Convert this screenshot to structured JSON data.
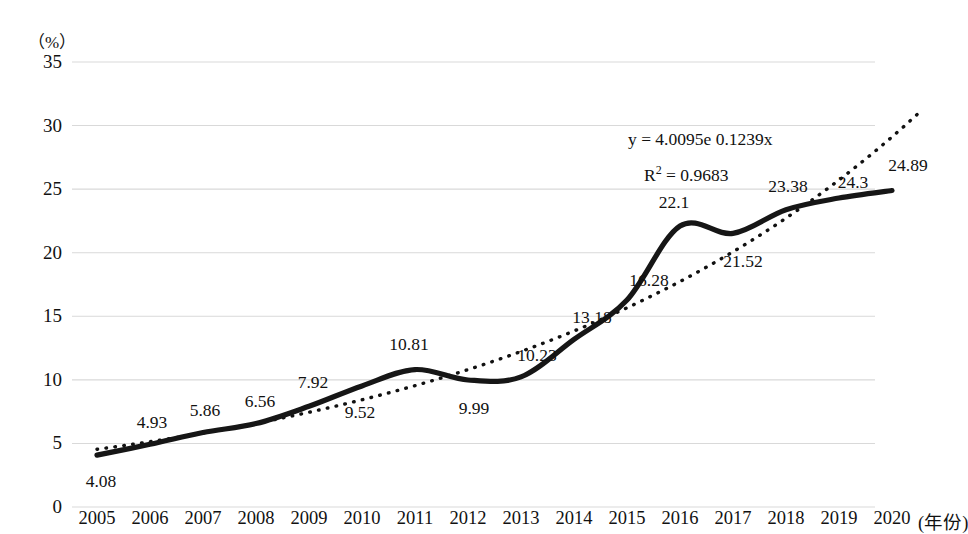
{
  "chart_data": {
    "type": "line",
    "title": "",
    "xlabel": "(年份)",
    "ylabel": "(%)",
    "x": [
      2005,
      2006,
      2007,
      2008,
      2009,
      2010,
      2011,
      2012,
      2013,
      2014,
      2015,
      2016,
      2017,
      2018,
      2019,
      2020
    ],
    "categories": [
      "2005",
      "2006",
      "2007",
      "2008",
      "2009",
      "2010",
      "2011",
      "2012",
      "2013",
      "2014",
      "2015",
      "2016",
      "2017",
      "2018",
      "2019",
      "2020"
    ],
    "values": [
      4.08,
      4.93,
      5.86,
      6.56,
      7.92,
      9.52,
      10.81,
      9.99,
      10.23,
      13.18,
      16.28,
      22.1,
      21.52,
      23.38,
      24.3,
      24.89
    ],
    "point_labels": [
      "4.08",
      "4.93",
      "5.86",
      "6.56",
      "7.92",
      "9.52",
      "10.81",
      "9.99",
      "10.23",
      "13.18",
      "16.28",
      "22.1",
      "21.52",
      "23.38",
      "24.3",
      "24.89"
    ],
    "ylim": [
      0,
      35
    ],
    "yticks": [
      "0",
      "5",
      "10",
      "15",
      "20",
      "25",
      "30",
      "35"
    ],
    "ytick_values": [
      0,
      5,
      10,
      15,
      20,
      25,
      30,
      35
    ],
    "grid": true,
    "legend": "none",
    "series": [
      {
        "name": "data-line",
        "style": "solid-thick-black",
        "values": [
          4.08,
          4.93,
          5.86,
          6.56,
          7.92,
          9.52,
          10.81,
          9.99,
          10.23,
          13.18,
          16.28,
          22.1,
          21.52,
          23.38,
          24.3,
          24.89
        ]
      },
      {
        "name": "exponential-trendline",
        "style": "dotted-black",
        "equation": "y = 4.0095e 0.1239x",
        "r_squared": "R² = 0.9683"
      }
    ],
    "annotations": [
      {
        "name": "trendline-equation",
        "text": "y = 4.0095e 0.1239x"
      },
      {
        "name": "trendline-r-squared",
        "text": "R²  = 0.9683"
      }
    ],
    "colors": {
      "line": "#111111",
      "trendline": "#111111",
      "gridline": "#d9d9d9",
      "background": "#ffffff",
      "text": "#111111"
    }
  },
  "axes": {
    "y_unit_label": "（%）",
    "x_unit_label": "(年份)"
  },
  "equation": {
    "formula_prefix": "y = 4.0095e",
    "formula_exponent": "0.1239x",
    "r2_symbol": "R",
    "r2_sup": "2",
    "r2_value": "= 0.9683"
  },
  "label_offsets": [
    {
      "dx": 4,
      "dy": 26
    },
    {
      "dx": 2,
      "dy": -22
    },
    {
      "dx": 2,
      "dy": -22
    },
    {
      "dx": 4,
      "dy": -23
    },
    {
      "dx": 4,
      "dy": -24
    },
    {
      "dx": -2,
      "dy": 26
    },
    {
      "dx": -6,
      "dy": -26
    },
    {
      "dx": 6,
      "dy": 28
    },
    {
      "dx": 16,
      "dy": -22
    },
    {
      "dx": 18,
      "dy": -22
    },
    {
      "dx": 22,
      "dy": -20
    },
    {
      "dx": -6,
      "dy": -24
    },
    {
      "dx": 10,
      "dy": 28
    },
    {
      "dx": 2,
      "dy": -24
    },
    {
      "dx": 14,
      "dy": -16
    },
    {
      "dx": 16,
      "dy": -26
    }
  ]
}
